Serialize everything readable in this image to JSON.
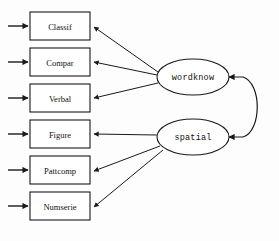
{
  "diagram": {
    "type": "sem-path-diagram",
    "background_color": "#fdfdfd",
    "stroke_color": "#1a1a1a",
    "observed_variables": [
      {
        "id": "classif",
        "label": "Classif",
        "x": 30,
        "y": 12,
        "w": 60,
        "h": 28
      },
      {
        "id": "compar",
        "label": "Compar",
        "x": 30,
        "y": 48,
        "w": 60,
        "h": 28
      },
      {
        "id": "verbal",
        "label": "Verbal",
        "x": 30,
        "y": 84,
        "w": 60,
        "h": 28
      },
      {
        "id": "figure",
        "label": "Figure",
        "x": 30,
        "y": 120,
        "w": 60,
        "h": 28
      },
      {
        "id": "pattcomp",
        "label": "Pattcomp",
        "x": 30,
        "y": 156,
        "w": 60,
        "h": 28
      },
      {
        "id": "numserie",
        "label": "Numserie",
        "x": 30,
        "y": 192,
        "w": 60,
        "h": 28
      }
    ],
    "latent_factors": [
      {
        "id": "wordknow",
        "label": "wordknow",
        "cx": 193,
        "cy": 77,
        "rx": 36,
        "ry": 18
      },
      {
        "id": "spatial",
        "label": "spatial",
        "cx": 193,
        "cy": 137,
        "rx": 36,
        "ry": 18
      }
    ],
    "loadings": [
      {
        "from": "wordknow",
        "to": "classif"
      },
      {
        "from": "wordknow",
        "to": "compar"
      },
      {
        "from": "wordknow",
        "to": "verbal"
      },
      {
        "from": "spatial",
        "to": "figure"
      },
      {
        "from": "spatial",
        "to": "pattcomp"
      },
      {
        "from": "spatial",
        "to": "numserie"
      }
    ],
    "covariance": {
      "from": "wordknow",
      "to": "spatial",
      "double_headed": true
    },
    "residuals": [
      {
        "to": "classif"
      },
      {
        "to": "compar"
      },
      {
        "to": "verbal"
      },
      {
        "to": "figure"
      },
      {
        "to": "pattcomp"
      },
      {
        "to": "numserie"
      }
    ]
  }
}
